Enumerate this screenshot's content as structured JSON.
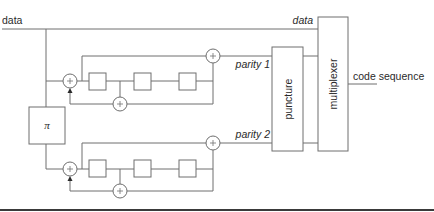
{
  "diagram": {
    "type": "turbo-encoder-block-diagram",
    "labels": {
      "data_input": "data",
      "data_output": "data",
      "parity1": "parity 1",
      "parity2": "parity 2",
      "interleaver": "π",
      "puncture": "puncture",
      "multiplexer": "multiplexer",
      "output": "code sequence"
    },
    "adder_symbol": "+",
    "encoders": [
      {
        "name": "encoder-1",
        "delay_elements": 3,
        "output": "parity 1"
      },
      {
        "name": "encoder-2",
        "delay_elements": 3,
        "output": "parity 2"
      }
    ],
    "colors": {
      "line": "#6e6e6e",
      "text": "#2a2a2a",
      "rule": "#3a3a3a",
      "background": "#ffffff"
    }
  }
}
